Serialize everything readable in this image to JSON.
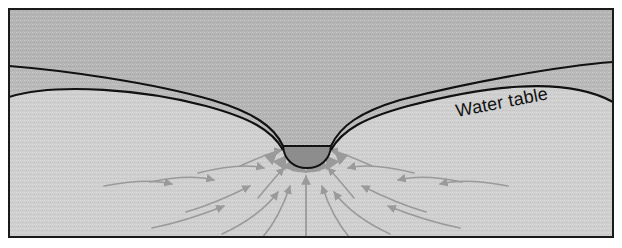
{
  "figure": {
    "labels": {
      "water_table": "Water table"
    },
    "colors": {
      "frame_border": "#1a1a1a",
      "unsaturated_zone": "#b4b4b4",
      "saturated_zone": "#cfcfcf",
      "capillary_band": "#b9b9b9",
      "lake_water": "#8d8d8d",
      "flow_arrow": "#9a9a9a",
      "line_stroke": "#111111",
      "page_background": "#ffffff"
    },
    "frame": {
      "x": 8,
      "y": 8,
      "width": 606,
      "height": 230
    },
    "geometry": {
      "water_table_left_start_y": 66,
      "water_table_right_end_y": 62,
      "capillary_left_start_y": 97,
      "capillary_right_end_y": 102,
      "lake_center_x": 306,
      "lake_surface_y": 146,
      "lake_bottom_y": 166,
      "lake_left_x": 283,
      "lake_right_x": 331
    },
    "annotations": {
      "label_rotation_degrees": -11,
      "label_x": 457,
      "label_y": 117
    },
    "flow": {
      "description": "Groundwater flow lines converge from both sides and from below toward the lake",
      "arrow_count_left": 9,
      "arrow_count_right": 9,
      "vertical_arrow": true
    }
  }
}
